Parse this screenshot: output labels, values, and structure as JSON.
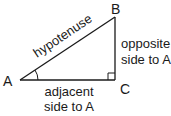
{
  "diagram": {
    "type": "right-triangle",
    "vertices": {
      "A": "A",
      "B": "B",
      "C": "C"
    },
    "right_angle_at": "C",
    "marked_angle_at": "A",
    "labels": {
      "hypotenuse": "hypotenuse",
      "opposite_line1": "opposite",
      "opposite_line2": "side to A",
      "adjacent_line1": "adjacent",
      "adjacent_line2": "side to A"
    },
    "stroke_color": "#1a1a1a",
    "background_color": "#ffffff"
  }
}
